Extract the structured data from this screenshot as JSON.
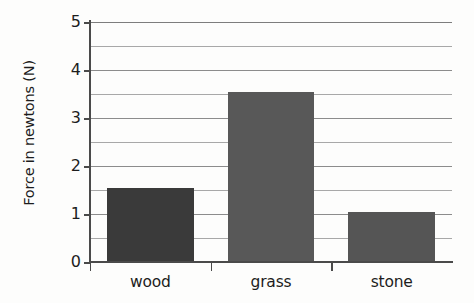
{
  "chart_data": {
    "type": "bar",
    "title": "",
    "xlabel": "",
    "ylabel": "Force in newtons (N)",
    "categories": [
      "wood",
      "grass",
      "stone"
    ],
    "values": [
      1.55,
      3.55,
      1.05
    ],
    "series": [
      {
        "name": "Force",
        "values": [
          1.55,
          3.55,
          1.05
        ]
      }
    ],
    "ylim": [
      0,
      5
    ],
    "y_ticks": [
      0,
      1,
      2,
      3,
      4,
      5
    ],
    "y_tick_labels": [
      "0",
      "1",
      "2",
      "3",
      "4",
      "5"
    ],
    "minor_gridline_step": 0.5,
    "gridlines": [
      0,
      0.5,
      1,
      1.5,
      2,
      2.5,
      3,
      3.5,
      4,
      4.5,
      5
    ],
    "grid": true,
    "legend": false,
    "legend_position": "none",
    "bar_colors": [
      "#3a3a3a",
      "#585858",
      "#555555"
    ],
    "background_color": "#fdfdfc",
    "axis_color": "#4a4a4a",
    "gridline_color": "#a8a8a8",
    "text_color": "#1d1d1d"
  }
}
